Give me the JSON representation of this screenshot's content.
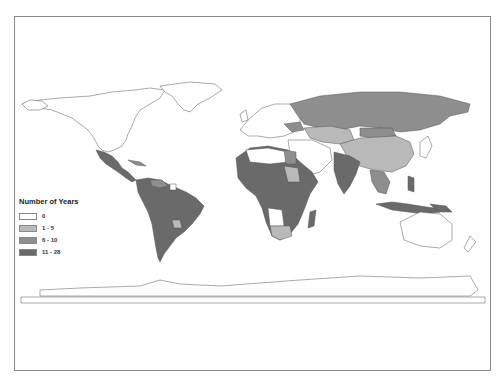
{
  "map": {
    "title": "",
    "projection": "world (equirectangular-like)",
    "legend": {
      "title": "Number of Years",
      "classes": [
        {
          "label": "0",
          "color": "#ffffff"
        },
        {
          "label": "1 - 5",
          "color": "#b9b9b9"
        },
        {
          "label": "6 - 10",
          "color": "#8e8e8e"
        },
        {
          "label": "11 - 28",
          "color": "#6a6a6a"
        }
      ]
    },
    "colors": {
      "outline": "#555555",
      "frame": "#8a8a8a",
      "zero": "#ffffff",
      "low": "#b9b9b9",
      "mid": "#8e8e8e",
      "high": "#6a6a6a"
    }
  }
}
